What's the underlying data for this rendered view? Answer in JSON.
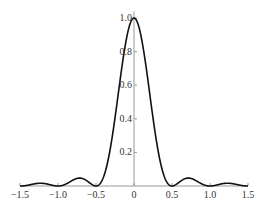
{
  "chart_data": {
    "type": "line",
    "title": "",
    "xlabel": "",
    "ylabel": "",
    "function": "(sin(2*pi*x)/(2*pi*x))^2",
    "xlim": [
      -1.5,
      1.5
    ],
    "ylim": [
      0,
      1.0
    ],
    "x_ticks": [
      "-1.5",
      "-1.0",
      "-0.5",
      "0",
      "0.5",
      "1.0",
      "1.5"
    ],
    "y_ticks": [
      "0.2",
      "0.4",
      "0.6",
      "0.8",
      "1.0"
    ],
    "x": [
      -1.5,
      -1.25,
      -1.0,
      -0.75,
      -0.5,
      -0.25,
      0,
      0.25,
      0.5,
      0.75,
      1.0,
      1.25,
      1.5
    ],
    "series": [
      {
        "name": "intensity",
        "values": [
          0.0,
          0.016,
          0.0,
          0.045,
          0.0,
          0.405,
          1.0,
          0.405,
          0.0,
          0.045,
          0.0,
          0.016,
          0.0
        ]
      }
    ],
    "grid": false,
    "legend": null,
    "line_color": "#111111",
    "axis_color": "#999999"
  }
}
